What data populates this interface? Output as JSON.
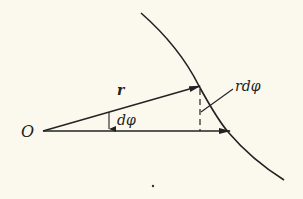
{
  "diagram": {
    "background": "#fbf9ee",
    "stroke_color": "#222222",
    "labels": {
      "origin": "O",
      "radius_vector": "r",
      "angle": "dφ",
      "arc_length": "rdφ"
    },
    "elements": {
      "origin_point": [
        43,
        131
      ],
      "radius_vector_tip": [
        199,
        86
      ],
      "horizontal_vector_tip": [
        229,
        131
      ],
      "curve_points": [
        [
          141,
          13
        ],
        [
          175,
          45
        ],
        [
          199,
          86
        ],
        [
          229,
          131
        ],
        [
          284,
          180
        ]
      ],
      "dashed_line": {
        "x": 200,
        "y_top": 88,
        "y_bottom": 131
      },
      "angle_arrow_x": 109
    }
  }
}
